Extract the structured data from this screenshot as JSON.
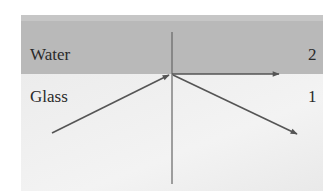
{
  "diagram": {
    "type": "optics-refraction-critical-angle",
    "media": [
      {
        "name": "Water",
        "index_label": "2",
        "position": "top",
        "color": "#b9b9b9"
      },
      {
        "name": "Glass",
        "index_label": "1",
        "position": "bottom",
        "color": "#eeeeee"
      }
    ],
    "labels": {
      "top_medium": "Water",
      "bottom_medium": "Glass",
      "top_index": "2",
      "bottom_index": "1"
    },
    "rays": [
      {
        "name": "incident-ray",
        "from": [
          52,
          133
        ],
        "to": [
          170,
          74
        ]
      },
      {
        "name": "refracted-ray-along-interface",
        "from": [
          172,
          74
        ],
        "to": [
          280,
          74
        ]
      },
      {
        "name": "reflected-ray",
        "from": [
          172,
          74
        ],
        "to": [
          298,
          134
        ]
      }
    ],
    "normal_line": {
      "x": 172,
      "y1": 32,
      "y2": 184
    },
    "interface_y": 74,
    "colors": {
      "background": "#ffffff",
      "panel": "#efefef",
      "top_band": "#b9b9b9",
      "ray": "#555555",
      "normal": "#666666",
      "text": "#2a2a2a"
    }
  }
}
